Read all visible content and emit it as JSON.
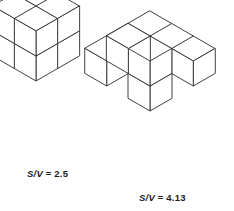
{
  "figure": {
    "background_color": "#ffffff",
    "line_color": "#2b2b2b",
    "face_color": "#ffffff"
  },
  "shapes": [
    {
      "id": "compact-block",
      "name": "compact 2x2x2 cube block",
      "cube_count": 8,
      "ratio_symbol": "S/V",
      "ratio_equals": "= 2.5",
      "ratio_value": 2.5,
      "origin": {
        "x": 36,
        "y": 31
      },
      "cell_size": 25,
      "cubes": [
        [
          0,
          0,
          0
        ],
        [
          1,
          0,
          0
        ],
        [
          0,
          1,
          0
        ],
        [
          1,
          1,
          0
        ],
        [
          0,
          0,
          1
        ],
        [
          1,
          0,
          1
        ],
        [
          0,
          1,
          1
        ],
        [
          1,
          1,
          1
        ]
      ]
    },
    {
      "id": "branched-block",
      "name": "branched cross-shaped cube assembly",
      "cube_count": 8,
      "ratio_symbol": "S/V",
      "ratio_equals": "= 4.13",
      "ratio_value": 4.13,
      "origin": {
        "x": 150,
        "y": 36
      },
      "cell_size": 25,
      "cubes": [
        [
          0,
          0,
          0
        ],
        [
          1,
          0,
          0
        ],
        [
          2,
          0,
          0
        ],
        [
          0,
          1,
          0
        ],
        [
          0,
          2,
          0
        ],
        [
          0,
          0,
          -1
        ],
        [
          0,
          0,
          -2
        ],
        [
          -1,
          0,
          -1
        ]
      ]
    }
  ],
  "captions": {
    "left": {
      "symbol": "S/V",
      "value": "= 2.5"
    },
    "right": {
      "symbol": "S/V",
      "value": "= 4.13"
    }
  }
}
